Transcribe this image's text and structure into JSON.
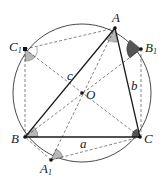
{
  "diagram": {
    "type": "geometry",
    "colors": {
      "stroke": "#1a1a1a",
      "angle_light": "#b8b8b8",
      "angle_dark": "#555555",
      "background": "#ffffff"
    },
    "circle": {
      "center": "O",
      "cx": 82,
      "cy": 93,
      "r": 69
    },
    "points": {
      "A": {
        "x": 115,
        "y": 28,
        "label": "A",
        "sub": ""
      },
      "B": {
        "x": 25,
        "y": 137,
        "label": "B",
        "sub": ""
      },
      "C": {
        "x": 140,
        "y": 137,
        "label": "C",
        "sub": ""
      },
      "A1": {
        "x": 51,
        "y": 160,
        "label": "A",
        "sub": "1"
      },
      "B1": {
        "x": 141,
        "y": 49,
        "label": "B",
        "sub": "1"
      },
      "C1": {
        "x": 25,
        "y": 49,
        "label": "C",
        "sub": "1"
      },
      "O": {
        "x": 82,
        "y": 93,
        "label": "O",
        "sub": ""
      }
    },
    "side_labels": {
      "a": "a",
      "b": "b",
      "c": "c"
    },
    "solid_segments": [
      [
        "A",
        "B"
      ],
      [
        "B",
        "C"
      ],
      [
        "C",
        "A"
      ]
    ],
    "dashed_segments": [
      [
        "C1",
        "A"
      ],
      [
        "C1",
        "B"
      ],
      [
        "C1",
        "C"
      ],
      [
        "B1",
        "A"
      ],
      [
        "B1",
        "C"
      ],
      [
        "B1",
        "B"
      ],
      [
        "A1",
        "B"
      ],
      [
        "A1",
        "C"
      ],
      [
        "A1",
        "A"
      ]
    ]
  }
}
